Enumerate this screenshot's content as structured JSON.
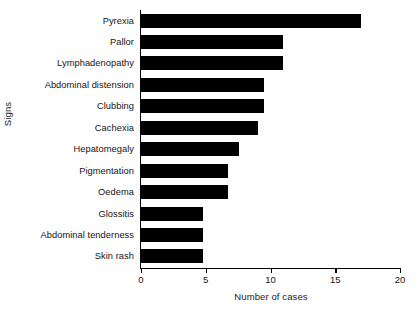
{
  "chart_data": {
    "type": "bar",
    "orientation": "horizontal",
    "title": "",
    "xlabel": "Number of cases",
    "ylabel": "Signs",
    "xlim": [
      0,
      20
    ],
    "xticks": [
      0,
      5,
      10,
      15,
      20
    ],
    "xtick_labels": [
      "0",
      "5",
      "10",
      "15",
      "20"
    ],
    "grid": false,
    "legend": null,
    "bar_color": "#000000",
    "categories": [
      "Skin rash",
      "Abdominal tenderness",
      "Glossitis",
      "Oedema",
      "Pigmentation",
      "Hepatomegaly",
      "Cachexia",
      "Clubbing",
      "Abdominal distension",
      "Lymphadenopathy",
      "Pallor",
      "Pyrexia"
    ],
    "values": [
      4.8,
      4.8,
      4.8,
      6.7,
      6.7,
      7.6,
      9.0,
      9.5,
      9.5,
      11.0,
      11.0,
      17.0
    ]
  }
}
